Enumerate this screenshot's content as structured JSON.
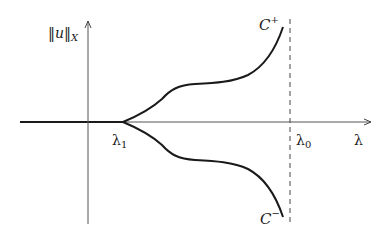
{
  "diagram": {
    "type": "bifurcation-diagram",
    "labels": {
      "y_axis": "‖u‖",
      "y_axis_sub": "X",
      "x_axis": "λ",
      "lambda1": "λ",
      "lambda1_sub": "1",
      "lambda0": "λ",
      "lambda0_sub": "0",
      "branch_upper": "C",
      "branch_upper_sup": "+",
      "branch_lower": "C",
      "branch_lower_sup": "−"
    },
    "elements": [
      {
        "id": "trivial-branch",
        "desc": "thick horizontal segment from left to λ1 on the λ-axis"
      },
      {
        "id": "upper-branch",
        "desc": "curve C+ bifurcating upward from λ1, blowing up near λ0"
      },
      {
        "id": "lower-branch",
        "desc": "curve C− bifurcating downward from λ1, blowing up near λ0"
      },
      {
        "id": "asymptote",
        "desc": "dashed vertical line at λ = λ0"
      }
    ],
    "colors": {
      "stroke": "#1a1a1a",
      "axis": "#555555",
      "background": "#ffffff"
    }
  }
}
